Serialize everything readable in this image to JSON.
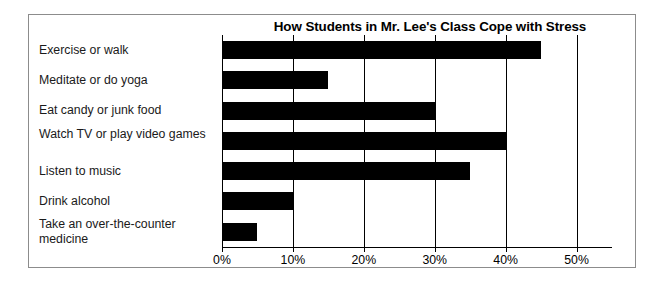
{
  "chart_data": {
    "type": "bar",
    "orientation": "horizontal",
    "title": "How Students in Mr. Lee's Class Cope with Stress",
    "xlabel": "",
    "ylabel": "",
    "categories": [
      "Exercise or walk",
      "Meditate or do yoga",
      "Eat candy or junk food",
      "Watch TV or play video games",
      "Listen to music",
      "Drink alcohol",
      "Take an over-the-counter medicine"
    ],
    "values": [
      45,
      15,
      30,
      40,
      35,
      10,
      5
    ],
    "value_unit": "%",
    "xlim": [
      0,
      55
    ],
    "xticks": [
      0,
      10,
      20,
      30,
      40,
      50
    ],
    "xtick_labels": [
      "0%",
      "10%",
      "20%",
      "30%",
      "40%",
      "50%"
    ],
    "grid": "vertical",
    "legend": "none",
    "bar_color": "#000000",
    "background_color": "#ffffff"
  }
}
